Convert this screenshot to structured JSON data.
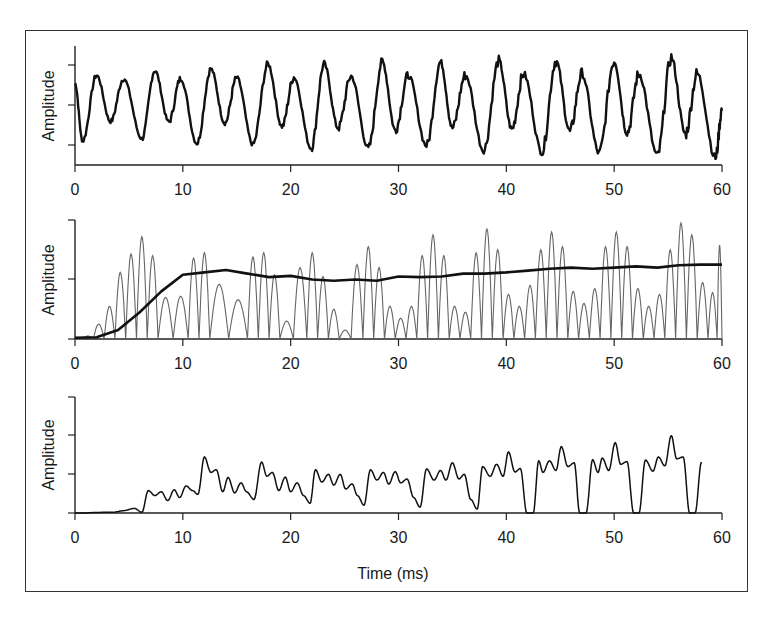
{
  "figure": {
    "xlabel": "Time (ms)",
    "x_ticks": [
      "0",
      "10",
      "20",
      "30",
      "40",
      "50",
      "60"
    ]
  },
  "chart_data": [
    {
      "type": "line",
      "title": "",
      "xlabel": "",
      "ylabel": "Amplitude",
      "xlim": [
        0,
        60
      ],
      "x_ticks": [
        0,
        10,
        20,
        30,
        40,
        50,
        60
      ],
      "y_ticks": [
        "low",
        "mid",
        "high"
      ],
      "grid": false,
      "series": [
        {
          "name": "waveform",
          "style": "thick-black",
          "description": "Periodic waveform, ~2.65 ms per cycle, alternating sharp and rounded peaks, increasing noise toward the end",
          "period_ms": 2.65,
          "x": [
            0,
            0.7,
            2.0,
            3.3,
            4.5,
            6.2,
            7.4,
            8.7,
            9.8,
            11.3,
            12.6,
            13.9,
            15.0,
            16.5,
            17.9,
            19.2,
            20.3,
            21.9,
            23.1,
            24.4,
            25.6,
            27.2,
            28.5,
            29.7,
            30.9,
            32.6,
            33.9,
            35.0,
            36.2,
            37.9,
            39.3,
            40.5,
            41.6,
            43.3,
            44.6,
            45.9,
            47.0,
            48.6,
            50.0,
            51.2,
            52.3,
            54.0,
            55.3,
            56.6,
            57.7,
            59.4,
            60.0
          ],
          "y": [
            0.45,
            -0.75,
            0.62,
            -0.35,
            0.55,
            -0.7,
            0.72,
            -0.35,
            0.55,
            -0.8,
            0.75,
            -0.38,
            0.57,
            -0.82,
            0.85,
            -0.45,
            0.58,
            -0.9,
            0.85,
            -0.48,
            0.6,
            -0.9,
            0.9,
            -0.52,
            0.62,
            -0.85,
            0.9,
            -0.48,
            0.62,
            -0.95,
            0.92,
            -0.5,
            0.65,
            -0.98,
            0.92,
            -0.55,
            0.65,
            -1.0,
            0.92,
            -0.58,
            0.65,
            -1.05,
            0.98,
            -0.6,
            0.65,
            -1.1,
            -0.1
          ]
        }
      ]
    },
    {
      "type": "line",
      "title": "",
      "xlabel": "",
      "ylabel": "Amplitude",
      "xlim": [
        0,
        60
      ],
      "ylim": [
        0,
        2
      ],
      "x_ticks": [
        0,
        10,
        20,
        30,
        40,
        50,
        60
      ],
      "y_ticks": [
        0,
        1,
        2
      ],
      "grid": false,
      "series": [
        {
          "name": "rectified-oscillation",
          "style": "thin-gray",
          "description": "Rectified oscillation peaks (each lobe returns to ~0)",
          "peak_x": [
            1.2,
            2.2,
            3.2,
            4.2,
            5.2,
            6.2,
            7.2,
            8.2,
            10.0,
            11.0,
            12.0,
            13.0,
            15.5,
            16.5,
            17.5,
            18.5,
            19.5,
            21.0,
            22.0,
            23.0,
            24.0,
            25.0,
            26.2,
            27.2,
            28.2,
            29.2,
            30.2,
            31.2,
            32.2,
            33.2,
            34.2,
            35.2,
            36.2,
            37.2,
            38.2,
            39.2,
            40.2,
            41.2,
            42.2,
            43.2,
            44.2,
            45.2,
            46.2,
            47.2,
            48.2,
            49.2,
            50.2,
            51.2,
            52.2,
            53.2,
            54.2,
            55.2,
            56.2,
            57.2,
            58.2,
            59.2,
            59.9
          ],
          "peak_y": [
            0.05,
            0.25,
            0.55,
            1.12,
            1.43,
            1.72,
            1.4,
            0.7,
            0.72,
            1.36,
            1.45,
            0.92,
            0.66,
            1.38,
            1.45,
            1.08,
            0.3,
            1.2,
            1.45,
            1.05,
            0.5,
            0.15,
            1.25,
            1.55,
            1.2,
            0.55,
            0.35,
            0.55,
            1.4,
            1.75,
            1.4,
            0.55,
            0.45,
            1.45,
            1.85,
            1.5,
            0.75,
            0.55,
            0.9,
            1.5,
            1.8,
            1.55,
            0.8,
            0.6,
            0.85,
            1.55,
            1.8,
            1.55,
            0.85,
            0.55,
            0.75,
            1.5,
            1.95,
            1.75,
            0.95,
            0.78,
            1.58
          ]
        },
        {
          "name": "envelope",
          "style": "thick-black",
          "description": "Smoothed amplitude envelope",
          "x": [
            0,
            2,
            4,
            6,
            8,
            10,
            12,
            14,
            16,
            18,
            20,
            22,
            24,
            26,
            28,
            30,
            32,
            34,
            36,
            38,
            40,
            42,
            44,
            46,
            48,
            50,
            52,
            54,
            56,
            58,
            60
          ],
          "y": [
            0.02,
            0.03,
            0.15,
            0.45,
            0.8,
            1.08,
            1.12,
            1.16,
            1.1,
            1.04,
            1.06,
            1.0,
            0.98,
            1.0,
            0.98,
            1.05,
            1.04,
            1.05,
            1.1,
            1.1,
            1.12,
            1.15,
            1.18,
            1.2,
            1.18,
            1.2,
            1.22,
            1.2,
            1.24,
            1.25,
            1.25
          ]
        }
      ]
    },
    {
      "type": "line",
      "title": "",
      "xlabel": "Time (ms)",
      "ylabel": "Amplitude",
      "xlim": [
        0,
        60
      ],
      "ylim": [
        0,
        3
      ],
      "x_ticks": [
        0,
        10,
        20,
        30,
        40,
        50,
        60
      ],
      "y_ticks": [
        0,
        1,
        2,
        3
      ],
      "grid": false,
      "series": [
        {
          "name": "output",
          "style": "thin-black",
          "x": [
            0,
            3.5,
            4.5,
            5.5,
            6.2,
            6.8,
            7.4,
            8.0,
            8.6,
            9.2,
            9.7,
            10.3,
            10.9,
            11.4,
            12.0,
            12.6,
            13.1,
            13.7,
            14.2,
            14.8,
            15.4,
            15.9,
            16.6,
            17.3,
            17.8,
            18.3,
            18.9,
            19.5,
            20.0,
            20.6,
            21.2,
            21.8,
            22.3,
            22.9,
            23.5,
            24.0,
            24.6,
            25.1,
            25.7,
            26.2,
            26.8,
            27.4,
            28.0,
            28.6,
            29.1,
            29.7,
            30.2,
            30.8,
            31.4,
            32.0,
            32.6,
            33.3,
            33.9,
            34.4,
            35.0,
            35.6,
            36.1,
            36.7,
            37.3,
            37.8,
            38.5,
            39.1,
            39.7,
            40.2,
            40.8,
            41.3,
            41.9,
            42.5,
            43.0,
            43.4,
            44.0,
            44.6,
            45.1,
            45.7,
            46.3,
            46.8,
            47.4,
            48.0,
            48.5,
            48.9,
            49.5,
            50.1,
            50.6,
            51.2,
            51.8,
            52.3,
            52.9,
            53.6,
            54.1,
            54.7,
            55.3,
            55.8,
            56.4,
            57.0,
            57.5,
            58.1,
            58.7,
            59.2,
            60.0
          ],
          "y": [
            0.0,
            0.02,
            0.06,
            0.12,
            0.02,
            0.58,
            0.45,
            0.55,
            0.32,
            0.6,
            0.4,
            0.7,
            0.58,
            0.48,
            1.45,
            1.05,
            1.12,
            0.55,
            0.92,
            0.52,
            0.78,
            0.55,
            0.35,
            1.32,
            0.95,
            1.05,
            0.58,
            0.93,
            0.55,
            0.78,
            0.45,
            0.25,
            1.12,
            0.8,
            1.0,
            0.72,
            1.0,
            0.62,
            0.75,
            0.45,
            0.2,
            1.12,
            0.85,
            1.05,
            0.75,
            1.07,
            0.78,
            0.88,
            0.4,
            0.15,
            1.14,
            0.85,
            1.1,
            0.85,
            1.3,
            0.88,
            1.0,
            0.35,
            0.1,
            1.2,
            0.95,
            1.26,
            0.95,
            1.58,
            1.06,
            1.15,
            0.0,
            0.0,
            1.35,
            1.05,
            1.35,
            1.1,
            1.72,
            1.2,
            1.3,
            0.0,
            0.0,
            1.38,
            1.05,
            1.42,
            1.1,
            1.82,
            1.26,
            1.33,
            0.0,
            0.0,
            1.37,
            1.08,
            1.45,
            1.22,
            2.0,
            1.4,
            1.45,
            0.0,
            0.0,
            1.32
          ]
        }
      ]
    }
  ]
}
